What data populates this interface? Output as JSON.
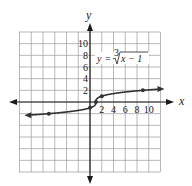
{
  "chart_data": {
    "type": "line",
    "title": "",
    "equation": "y = ∛(x − 1)",
    "equation_parts": {
      "lhs": "y =",
      "index": "3",
      "radicand": "x − 1"
    },
    "xlabel": "x",
    "ylabel": "y",
    "xlim": [
      -12,
      12
    ],
    "ylim": [
      -12,
      12
    ],
    "grid": true,
    "grid_step": 2,
    "x_ticks": [
      "2",
      "4",
      "6",
      "8",
      "10"
    ],
    "y_ticks": [
      "2",
      "4",
      "6",
      "8",
      "10"
    ],
    "series": [
      {
        "name": "y = ∛(x − 1)",
        "points": [
          [
            -7,
            -2
          ],
          [
            0,
            -1
          ],
          [
            1,
            0
          ],
          [
            2,
            1
          ],
          [
            9,
            2
          ]
        ],
        "marked_points": [
          [
            -7,
            -2
          ],
          [
            0,
            -1
          ],
          [
            1,
            0
          ],
          [
            2,
            1
          ],
          [
            9,
            2
          ]
        ],
        "domain_drawn": [
          -10.5,
          12
        ],
        "arrows_both_ends": true
      }
    ],
    "legend": null
  },
  "colors": {
    "grid": "#9a9a9a",
    "axis": "#1a1a1a",
    "curve": "#333333"
  }
}
